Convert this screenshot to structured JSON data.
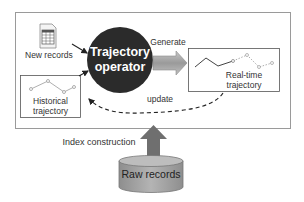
{
  "diagram": {
    "operator": {
      "line1": "Trajectory",
      "line2": "operator"
    },
    "inputs": {
      "new_records": "New records",
      "historical": {
        "line1": "Historical",
        "line2": "trajectory"
      }
    },
    "output": {
      "line1": "Real-time",
      "line2": "trajectory"
    },
    "edges": {
      "generate": "Generate",
      "update": "update",
      "index_construction": "Index construction"
    },
    "storage": {
      "label": "Raw records"
    },
    "colors": {
      "operator_fill": "#2b2b2b",
      "frame_stroke": "#9a9a9a",
      "arrow_gray": "#6f6f6f",
      "generate_arrow": "#a9a9a9",
      "cylinder_fill": "#a6a6a6",
      "text": "#333333"
    }
  }
}
